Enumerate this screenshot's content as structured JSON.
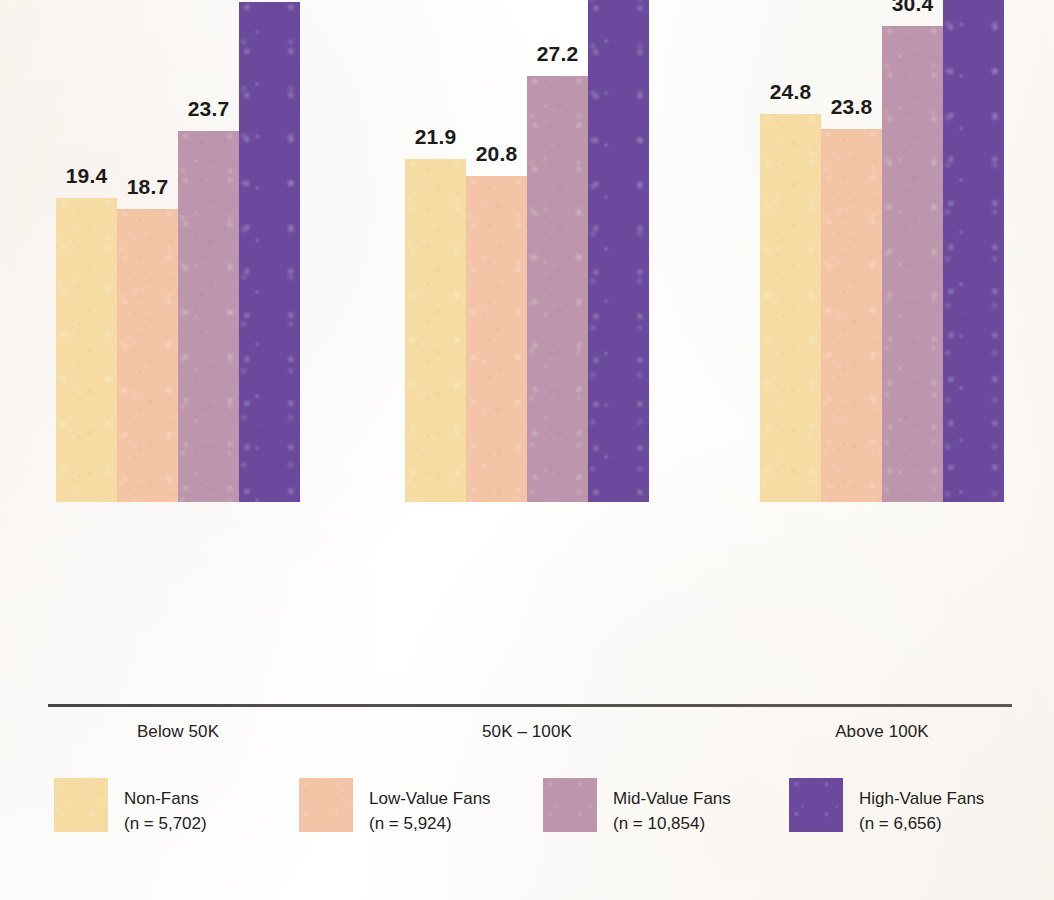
{
  "chart_data": {
    "type": "bar",
    "title": "",
    "subtitle": "",
    "xlabel": "",
    "ylabel": "",
    "ylim": [
      0,
      42
    ],
    "grid": false,
    "legend_position": "bottom",
    "categories": [
      "Below 50K",
      "50K – 100K",
      "Above 100K"
    ],
    "series": [
      {
        "name": "Non-Fans",
        "n_label": "(n = 5,702)",
        "color": "#F6DCA2",
        "values": [
          19.4,
          18.7,
          24.8
        ],
        "value_labels": [
          "19.4",
          "18.7",
          "24.8"
        ]
      },
      {
        "name": "Low-Value Fans",
        "n_label": "(n = 5,924)",
        "color": "#F3C4A6",
        "values": [
          18.7,
          20.8,
          23.8
        ],
        "value_labels": [
          "18.7",
          "20.8",
          "23.8"
        ]
      },
      {
        "name": "Mid-Value Fans",
        "n_label": "(n = 10,854)",
        "color": "#BD95AC",
        "values": [
          23.7,
          27.2,
          30.4
        ],
        "value_labels": [
          "23.7",
          "27.2",
          "30.4"
        ]
      },
      {
        "name": "High-Value Fans",
        "n_label": "(n = 6,656)",
        "color": "#6B4A9E",
        "values": [
          31.9,
          34.7,
          39.1
        ],
        "value_labels": [
          "31.9",
          "34.7",
          "39.1"
        ]
      }
    ],
    "groups": [
      {
        "category": "Below 50K",
        "bars": [
          {
            "series": "Non-Fans",
            "value": 19.4,
            "label": "19.4",
            "color": "#F6DCA2"
          },
          {
            "series": "Low-Value Fans",
            "value": 18.7,
            "label": "18.7",
            "color": "#F3C4A6"
          },
          {
            "series": "Mid-Value Fans",
            "value": 23.7,
            "label": "23.7",
            "color": "#BD95AC"
          },
          {
            "series": "High-Value Fans",
            "value": 31.9,
            "label": "31.9",
            "color": "#6B4A9E"
          }
        ]
      },
      {
        "category": "50K – 100K",
        "bars": [
          {
            "series": "Non-Fans",
            "value": 21.9,
            "label": "21.9",
            "color": "#F6DCA2"
          },
          {
            "series": "Low-Value Fans",
            "value": 20.8,
            "label": "20.8",
            "color": "#F3C4A6"
          },
          {
            "series": "Mid-Value Fans",
            "value": 27.2,
            "label": "27.2",
            "color": "#BD95AC"
          },
          {
            "series": "High-Value Fans",
            "value": 34.7,
            "label": "34.7",
            "color": "#6B4A9E"
          }
        ]
      },
      {
        "category": "Above 100K",
        "bars": [
          {
            "series": "Non-Fans",
            "value": 24.8,
            "label": "24.8",
            "color": "#F6DCA2"
          },
          {
            "series": "Low-Value Fans",
            "value": 23.8,
            "label": "23.8",
            "color": "#F3C4A6"
          },
          {
            "series": "Mid-Value Fans",
            "value": 30.4,
            "label": "30.4",
            "color": "#BD95AC"
          },
          {
            "series": "High-Value Fans",
            "value": 39.1,
            "label": "39.1",
            "color": "#6B4A9E"
          }
        ]
      }
    ]
  },
  "legend": {
    "items": [
      {
        "name": "Non-Fans",
        "n_label": "(n = 5,702)",
        "color": "#F6DCA2"
      },
      {
        "name": "Low-Value Fans",
        "n_label": "(n = 5,924)",
        "color": "#F3C4A6"
      },
      {
        "name": "Mid-Value Fans",
        "n_label": "(n = 10,854)",
        "color": "#BD95AC"
      },
      {
        "name": "High-Value Fans",
        "n_label": "(n = 6,656)",
        "color": "#6B4A9E"
      }
    ]
  },
  "axis": {
    "categories": [
      "Below 50K",
      "50K – 100K",
      "Above 100K"
    ]
  },
  "colors": {
    "background": "#fdfcfa",
    "axis_line": "#4f4b48",
    "label_text": "#1d1b1a",
    "non_fans": "#F6DCA2",
    "low_value_fans": "#F3C4A6",
    "mid_value_fans": "#BD95AC",
    "high_value_fans": "#6B4A9E"
  }
}
